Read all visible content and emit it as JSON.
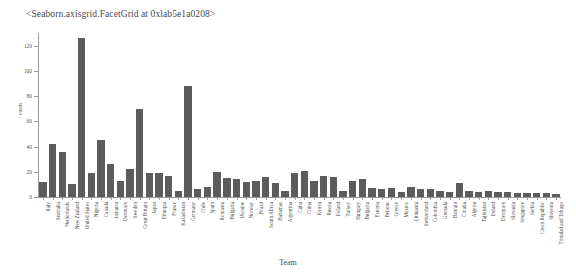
{
  "figure": {
    "repr_title": "<Seaborn.axisgrid.FacetGrid at 0xlab5e1a0208>",
    "bar_color": "#5c5c5c",
    "axis_color": "#9a9a9a"
  },
  "chart_data": {
    "type": "bar",
    "title": "<Seaborn.axisgrid.FacetGrid at 0xlab5e1a0208>",
    "xlabel": "Team",
    "ylabel": "count",
    "ylim": [
      0,
      130
    ],
    "yticks": [
      0,
      20,
      40,
      60,
      80,
      100,
      120
    ],
    "grid": false,
    "legend": null,
    "orientation": "vertical",
    "categories": [
      "Italy",
      "Australia",
      "Netherlands",
      "New Zealand",
      "United States",
      "Nigeria",
      "Canada",
      "Jamaica",
      "Denmark",
      "Sweden",
      "Great Britain",
      "Japan",
      "Ethiopia",
      "France",
      "Kazakhstan",
      "Germany",
      "Chile",
      "Spain",
      "Romania",
      "Bulgaria",
      "Ukraine",
      "Norway",
      "Brazil",
      "South Africa",
      "Bahamas",
      "Argentina",
      "Cuba",
      "China",
      "Kenya",
      "Russia",
      "Poland",
      "Turkey",
      "Hungary",
      "Bulgaria",
      "Estonia",
      "Belarus",
      "Greece",
      "Mexico",
      "Lithuania",
      "Switzerland",
      "Colombia",
      "Grenada",
      "Bahrain",
      "Croatia",
      "Algeria",
      "Tajikistan",
      "Ireland",
      "Denmark",
      "Slovakia",
      "Singapore",
      "Serbia",
      "Czech Republic",
      "Slovenia",
      "Trinidad and Tobago"
    ],
    "values": [
      12,
      42,
      36,
      10,
      126,
      19,
      45,
      26,
      13,
      22,
      70,
      19,
      19,
      17,
      5,
      88,
      6,
      8,
      20,
      15,
      14,
      12,
      13,
      16,
      11,
      5,
      19,
      21,
      13,
      17,
      16,
      5,
      13,
      14,
      7,
      6,
      7,
      4,
      8,
      6,
      6,
      5,
      4,
      11,
      5,
      4,
      5,
      4,
      4,
      3,
      3,
      3,
      3,
      2
    ]
  }
}
